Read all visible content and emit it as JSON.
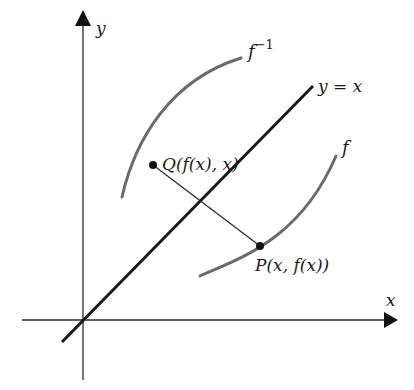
{
  "diagram": {
    "axes": {
      "x_label": "x",
      "y_label": "y",
      "origin": [
        83,
        320
      ],
      "x_axis": {
        "from": [
          22,
          320
        ],
        "to": [
          398,
          320
        ]
      },
      "y_axis": {
        "from": [
          83,
          380
        ],
        "to": [
          83,
          10
        ]
      }
    },
    "line_identity": {
      "label": "y = x",
      "from": [
        62,
        342
      ],
      "to": [
        313,
        86
      ],
      "color": "#1a1a1a"
    },
    "curve_f": {
      "label": "f",
      "color": "#6b6b6b",
      "path": "M200,276 C240,258 300,240 336,156"
    },
    "curve_f_inverse": {
      "label": "f",
      "superscript": "−1",
      "color": "#6b6b6b",
      "path": "M122,197 C135,140 170,80 241,58"
    },
    "point_P": {
      "label": "P(x, f(x))",
      "coords": [
        260,
        246
      ]
    },
    "point_Q": {
      "label": "Q(f(x), x)",
      "coords": [
        153,
        165
      ]
    },
    "segment_PQ": {
      "from": [
        153,
        165
      ],
      "to": [
        260,
        246
      ]
    }
  }
}
